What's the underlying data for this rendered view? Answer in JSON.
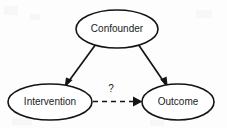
{
  "diagram": {
    "type": "causal-dag",
    "background_color": "#fdfdfd",
    "stroke_color": "#141414",
    "text_color": "#1b1b1b",
    "nodes": [
      {
        "id": "confounder",
        "label": "Confounder",
        "shape": "ellipse",
        "cx": 117,
        "cy": 29,
        "rx": 41,
        "ry": 19
      },
      {
        "id": "intervention",
        "label": "Intervention",
        "shape": "ellipse",
        "cx": 50,
        "cy": 102,
        "rx": 42,
        "ry": 18
      },
      {
        "id": "outcome",
        "label": "Outcome",
        "shape": "ellipse",
        "cx": 178,
        "cy": 102,
        "rx": 36,
        "ry": 18
      }
    ],
    "edges": [
      {
        "id": "confounder-to-intervention",
        "from": "confounder",
        "to": "intervention",
        "style": "solid",
        "arrow": "to",
        "label": ""
      },
      {
        "id": "confounder-to-outcome",
        "from": "confounder",
        "to": "outcome",
        "style": "solid",
        "arrow": "to",
        "label": ""
      },
      {
        "id": "intervention-to-outcome",
        "from": "intervention",
        "to": "outcome",
        "style": "dashed",
        "arrow": "to",
        "label": "?"
      }
    ]
  }
}
